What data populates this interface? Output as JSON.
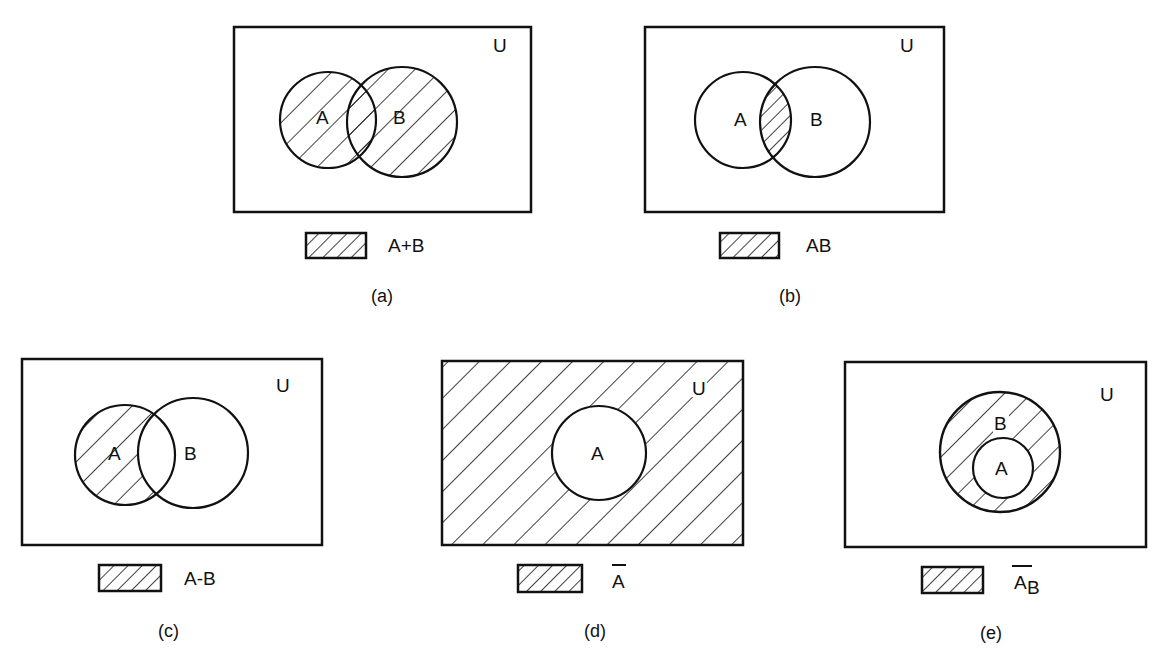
{
  "figure": {
    "universe_label": "U",
    "stroke_color": "#111111",
    "background_color": "#ffffff"
  },
  "panels": [
    {
      "id": "a",
      "caption": "(a)",
      "universe_label": "U",
      "sets": [
        "A",
        "B"
      ],
      "legend_label": "A+B",
      "shaded_region": "union of A and B"
    },
    {
      "id": "b",
      "caption": "(b)",
      "universe_label": "U",
      "sets": [
        "A",
        "B"
      ],
      "legend_label": "AB",
      "shaded_region": "intersection of A and B"
    },
    {
      "id": "c",
      "caption": "(c)",
      "universe_label": "U",
      "sets": [
        "A",
        "B"
      ],
      "legend_label": "A-B",
      "shaded_region": "A minus B"
    },
    {
      "id": "d",
      "caption": "(d)",
      "universe_label": "U",
      "sets": [
        "A"
      ],
      "legend_label": "A",
      "legend_overbar": true,
      "shaded_region": "complement of A"
    },
    {
      "id": "e",
      "caption": "(e)",
      "universe_label": "U",
      "sets": [
        "B",
        "A"
      ],
      "legend_label": "A",
      "legend_subscript": "B",
      "legend_overbar": true,
      "shaded_region": "complement of A relative to B"
    }
  ]
}
